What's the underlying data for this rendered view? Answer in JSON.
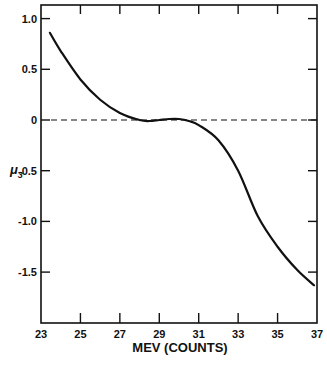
{
  "chart_data": {
    "type": "line",
    "title": "",
    "xlabel": "MEV (COUNTS)",
    "ylabel": "μ3",
    "xlim": [
      23,
      37
    ],
    "ylim": [
      -2.0,
      1.13
    ],
    "x_ticks": [
      23,
      25,
      27,
      29,
      31,
      33,
      35,
      37
    ],
    "x_tick_labels": [
      "23",
      "25",
      "27",
      "29",
      "31",
      "33",
      "35",
      "37"
    ],
    "y_ticks": [
      1.0,
      0.5,
      0,
      -0.5,
      -1.0,
      -1.5
    ],
    "y_tick_labels": [
      "1.0",
      "0.5",
      "0",
      "-0.5",
      "-1.0",
      "-1.5"
    ],
    "grid": false,
    "legend": null,
    "reference_line": {
      "y": 0,
      "style": "dashed"
    },
    "series": [
      {
        "name": "μ3",
        "x": [
          23.45,
          24,
          25,
          26,
          27,
          28,
          28.5,
          29,
          29.5,
          30,
          30.5,
          31,
          32,
          33,
          34,
          35,
          36,
          36.85
        ],
        "y": [
          0.86,
          0.68,
          0.4,
          0.2,
          0.07,
          0.0,
          -0.01,
          0.0,
          0.01,
          0.01,
          -0.01,
          -0.05,
          -0.2,
          -0.5,
          -0.95,
          -1.25,
          -1.48,
          -1.63
        ]
      }
    ]
  },
  "labels": {
    "xlabel": "MEV (COUNTS)",
    "ylabel_main": "μ",
    "ylabel_sub": "3"
  }
}
